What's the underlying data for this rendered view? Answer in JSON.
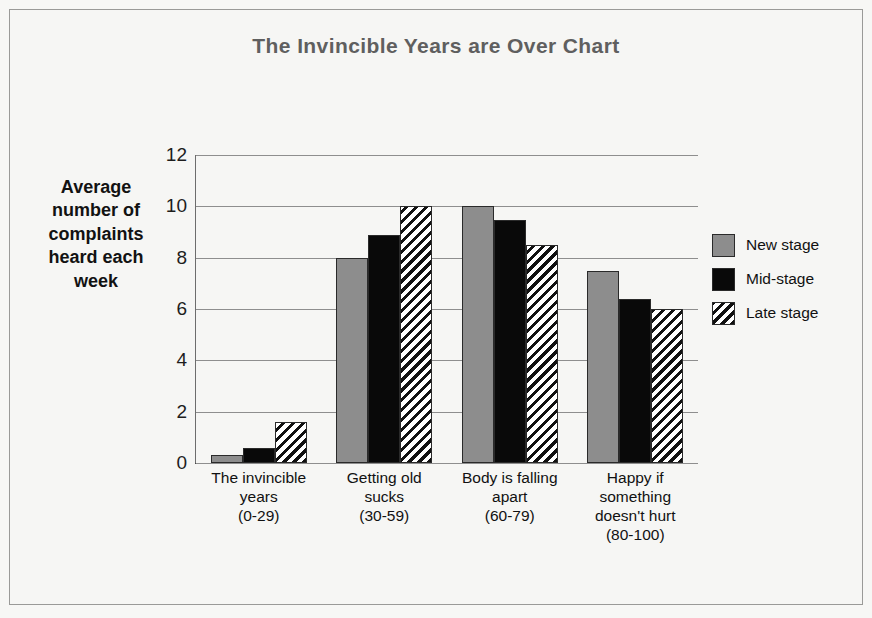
{
  "chart_data": {
    "type": "bar",
    "title": "The Invincible Years are Over Chart",
    "xlabel": "",
    "ylabel": "Average number of complaints heard each week",
    "ylim": [
      0,
      12
    ],
    "ytick_labels": [
      "0",
      "2",
      "4",
      "6",
      "8",
      "10",
      "12"
    ],
    "yticks": [
      0,
      2,
      4,
      6,
      8,
      10,
      12
    ],
    "grid": true,
    "legend_position": "right",
    "categories": [
      "The invincible years (0-29)",
      "Getting old sucks (30-59)",
      "Body is falling apart (60-79)",
      "Happy if something doesn't hurt (80-100)"
    ],
    "category_lines": [
      [
        "The invincible",
        "years",
        "(0-29)"
      ],
      [
        "Getting old",
        "sucks",
        "(30-59)"
      ],
      [
        "Body is falling",
        "apart",
        "(60-79)"
      ],
      [
        "Happy if",
        "something",
        "doesn't hurt",
        "(80-100)"
      ]
    ],
    "series": [
      {
        "name": "New stage",
        "key": "new",
        "color": "#8d8d8d",
        "values": [
          0.3,
          8.0,
          10.0,
          7.5
        ]
      },
      {
        "name": "Mid-stage",
        "key": "mid",
        "color": "#090909",
        "values": [
          0.6,
          8.9,
          9.45,
          6.4
        ]
      },
      {
        "name": "Late stage",
        "key": "late",
        "color": "#ffffff",
        "values": [
          1.6,
          10.0,
          8.5,
          6.0
        ]
      }
    ]
  },
  "legend": {
    "items": [
      {
        "label": "New stage",
        "key": "new"
      },
      {
        "label": "Mid-stage",
        "key": "mid"
      },
      {
        "label": "Late stage",
        "key": "late"
      }
    ]
  },
  "y_axis_title_lines": [
    "Average",
    "number of",
    "complaints",
    "heard each",
    "week"
  ]
}
